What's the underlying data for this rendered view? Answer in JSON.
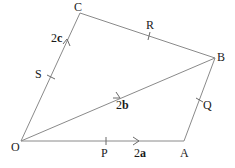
{
  "diagram": {
    "type": "vector-quadrilateral",
    "vertices": [
      {
        "id": "O",
        "label": "O",
        "x": 21,
        "y": 141
      },
      {
        "id": "A",
        "label": "A",
        "x": 184,
        "y": 141
      },
      {
        "id": "B",
        "label": "B",
        "x": 215,
        "y": 58
      },
      {
        "id": "C",
        "label": "C",
        "x": 80,
        "y": 13
      }
    ],
    "edges": [
      {
        "from": "O",
        "to": "A"
      },
      {
        "from": "A",
        "to": "B"
      },
      {
        "from": "B",
        "to": "C"
      },
      {
        "from": "C",
        "to": "O"
      },
      {
        "from": "O",
        "to": "B"
      }
    ],
    "midpoints": [
      {
        "label": "P",
        "on": "OA"
      },
      {
        "label": "Q",
        "on": "AB"
      },
      {
        "label": "R",
        "on": "BC"
      },
      {
        "label": "S",
        "on": "OC"
      }
    ],
    "vectors": [
      {
        "name": "OA",
        "coef": "2",
        "symbol": "a"
      },
      {
        "name": "OB",
        "coef": "2",
        "symbol": "b"
      },
      {
        "name": "OC",
        "coef": "2",
        "symbol": "c"
      }
    ],
    "colors": {
      "line": "#8a8a8a",
      "text": "#1a1a1a",
      "background": "#ffffff"
    }
  }
}
